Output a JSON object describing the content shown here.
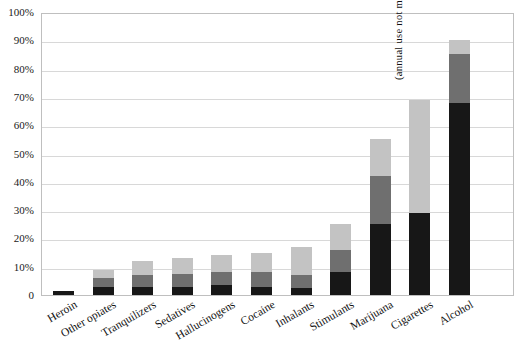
{
  "chart_data": {
    "type": "bar",
    "subtype": "stacked-bar",
    "title": "",
    "subtitle": "",
    "xlabel": "",
    "ylabel": "",
    "ylim": [
      0,
      100
    ],
    "ytick_labels": [
      "0",
      "10%",
      "20%",
      "30%",
      "40%",
      "50%",
      "60%",
      "70%",
      "80%",
      "90%",
      "100%"
    ],
    "ytick_values": [
      0,
      10,
      20,
      30,
      40,
      50,
      60,
      70,
      80,
      90,
      100
    ],
    "grid": true,
    "legend": "none",
    "categories": [
      "Heroin",
      "Other opiates",
      "Tranquilizers",
      "Sedatives",
      "Hallucinogens",
      "Cocaine",
      "Inhalants",
      "Stimulants",
      "Marijuana",
      "Cigarettes",
      "Alcohol"
    ],
    "series": [
      {
        "name": "past-month use",
        "color": "#171717",
        "values": [
          1.5,
          3,
          3,
          3,
          3.5,
          3,
          2.5,
          8,
          25,
          29,
          68
        ]
      },
      {
        "name": "annual use",
        "color": "#6f6f6f",
        "values": [
          0,
          3,
          4,
          4.5,
          4.5,
          5,
          4.5,
          8,
          17,
          0,
          17
        ]
      },
      {
        "name": "lifetime use",
        "color": "#c3c3c3",
        "values": [
          0,
          3,
          5,
          5.5,
          6,
          7,
          10,
          9,
          13,
          40,
          5
        ]
      }
    ],
    "totals": [
      1.5,
      9,
      12,
      13,
      14,
      15,
      17,
      25,
      55,
      69,
      90
    ],
    "annotations": [
      {
        "text": "(annual use not measured)",
        "category": "Cigarettes",
        "orientation": "vertical"
      }
    ]
  }
}
